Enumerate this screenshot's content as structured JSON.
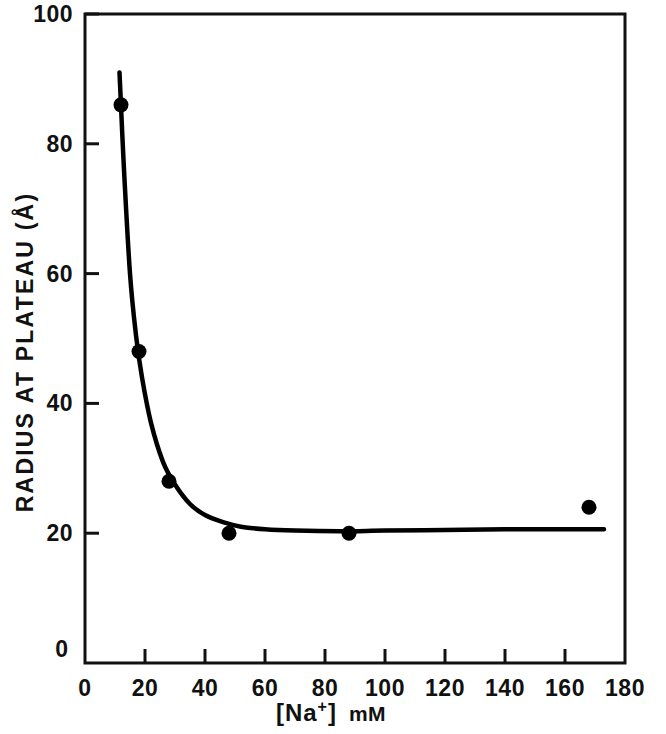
{
  "chart_data": {
    "type": "line",
    "title": "",
    "subtitle": "",
    "xlabel": "[Na+] mM",
    "xlabel_prefix": "[Na",
    "xlabel_sup": "+",
    "xlabel_bracket": "]",
    "xlabel_unit": "mM",
    "ylabel": "RADIUS AT PLATEAU (Å)",
    "xlim": [
      0,
      180
    ],
    "ylim": [
      0,
      100
    ],
    "x_ticks": [
      0,
      20,
      40,
      60,
      80,
      100,
      120,
      140,
      160,
      180
    ],
    "x_tick_labels": [
      "0",
      "20",
      "40",
      "60",
      "80",
      "100",
      "120",
      "140",
      "160",
      "180"
    ],
    "y_ticks": [
      0,
      20,
      40,
      60,
      80,
      100
    ],
    "y_tick_labels": [
      "0",
      "20",
      "40",
      "60",
      "80",
      "100"
    ],
    "grid": false,
    "legend": "none",
    "series": [
      {
        "name": "Radius at plateau",
        "marker": "filled-circle",
        "marker_color": "#000000",
        "line_color": "#000000",
        "x": [
          12,
          18,
          28,
          48,
          88,
          168
        ],
        "values": [
          86,
          48,
          28,
          20,
          20,
          24
        ]
      }
    ],
    "fit_curve": {
      "name": "fitted decay curve",
      "x": [
        11.5,
        13,
        15,
        17,
        19,
        22,
        26,
        30,
        35,
        40,
        46,
        52,
        60,
        70,
        85,
        100,
        120,
        140,
        160,
        173
      ],
      "y": [
        91,
        76,
        60,
        50.5,
        44,
        37,
        31,
        27.5,
        24.5,
        22.8,
        21.7,
        21.0,
        20.6,
        20.4,
        20.3,
        20.4,
        20.5,
        20.6,
        20.6,
        20.6
      ]
    },
    "axis_color": "#111111",
    "background": "#ffffff"
  },
  "plot_geometry": {
    "left": 85,
    "right": 625,
    "top": 14,
    "bottom": 663
  },
  "origin_label": "0"
}
